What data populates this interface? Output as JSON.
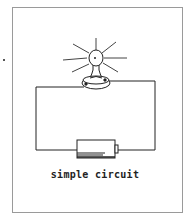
{
  "diagram": {
    "caption": "simple circuit",
    "components": [
      "light-bulb",
      "bulb-holder",
      "wire",
      "battery"
    ],
    "colors": {
      "line": "#222222",
      "frame": "#9a9a9a",
      "background": "#ffffff"
    }
  }
}
